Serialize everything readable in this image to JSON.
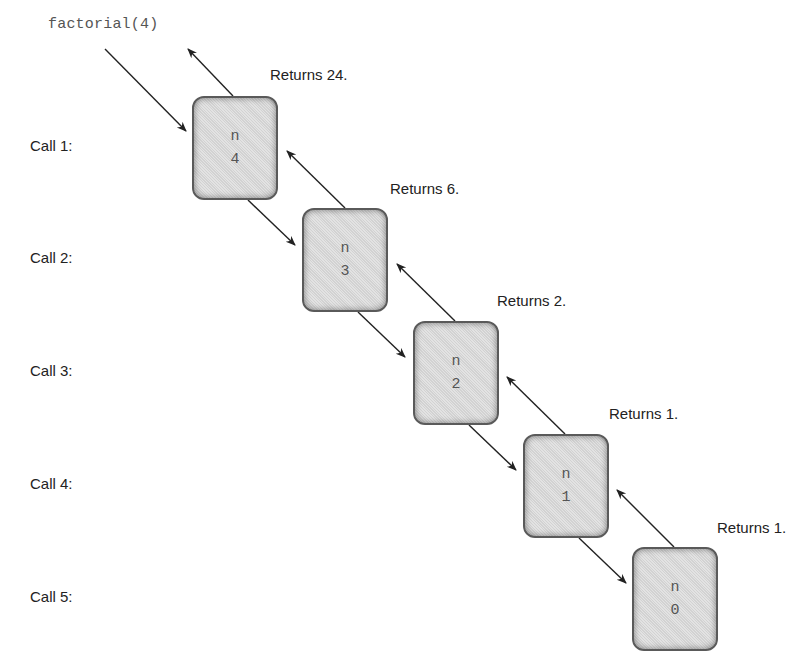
{
  "diagram": {
    "title_expression": "factorial(4)",
    "calls": [
      {
        "label": "Call 1:",
        "var_name": "n",
        "var_value": "4",
        "returns": "Returns 24."
      },
      {
        "label": "Call 2:",
        "var_name": "n",
        "var_value": "3",
        "returns": "Returns 6."
      },
      {
        "label": "Call 3:",
        "var_name": "n",
        "var_value": "2",
        "returns": "Returns 2."
      },
      {
        "label": "Call 4:",
        "var_name": "n",
        "var_value": "1",
        "returns": "Returns 1."
      },
      {
        "label": "Call 5:",
        "var_name": "n",
        "var_value": "0",
        "returns": "Returns 1."
      }
    ],
    "colors": {
      "frame_fill": "#d9d9d9",
      "frame_border": "#5a5a5a",
      "arrow": "#222222",
      "text": "#222222",
      "code_text": "#555555"
    }
  }
}
